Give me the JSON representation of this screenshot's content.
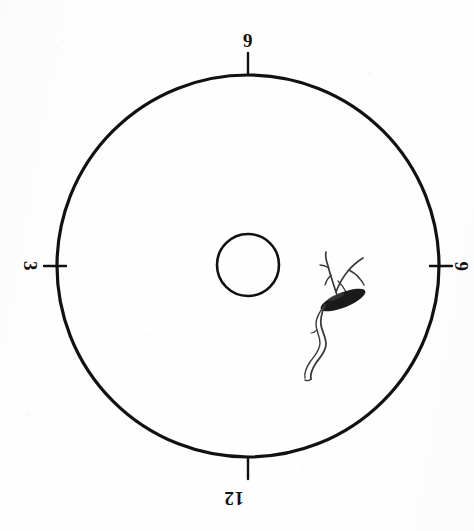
{
  "figure": {
    "medium": "scanned ink drawing on white paper",
    "background_color": "#fefefe",
    "ink_color": "#111111"
  },
  "outer_circle": {
    "name": "outer-dial-circle",
    "center_x": 248,
    "center_y": 266,
    "radius": 191,
    "stroke_color": "#111111",
    "stroke_width": 3.2
  },
  "inner_circle": {
    "name": "inner-hub-circle",
    "center_x": 248,
    "center_y": 265,
    "radius": 31,
    "stroke_color": "#111111",
    "stroke_width": 2.6
  },
  "dial_marks": [
    {
      "id": "mark-top",
      "label": "9",
      "position": "top",
      "angle_deg": 270,
      "tick_length": 22,
      "label_rotation_deg": 0
    },
    {
      "id": "mark-left",
      "label": "3",
      "position": "left",
      "angle_deg": 180,
      "tick_length": 22,
      "label_rotation_deg": 90
    },
    {
      "id": "mark-right",
      "label": "6",
      "position": "right",
      "angle_deg": 0,
      "tick_length": 22,
      "label_rotation_deg": -90
    },
    {
      "id": "mark-bottom",
      "label": "12",
      "position": "bottom",
      "angle_deg": 90,
      "tick_length": 22,
      "label_rotation_deg": 180
    }
  ],
  "specimen": {
    "name": "specimen-sketch",
    "description": "dark elongated seed body with branching filaments above and a wavy root tail below",
    "body_center_x": 343,
    "body_center_y": 300,
    "body_length": 48,
    "body_width": 15,
    "body_rotation_deg": -22,
    "body_fill": "#1a1a1a",
    "filament_color": "#3a3a3a",
    "filament_width": 1.6,
    "bounding_box": {
      "x": 296,
      "y": 252,
      "width": 80,
      "height": 130
    }
  }
}
